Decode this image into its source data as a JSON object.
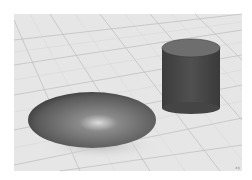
{
  "scene": {
    "description": "3D viewport render with ellipsoid and cylinder on grid floor",
    "objects": [
      {
        "name": "ellipsoid",
        "color": "#6a6a6a"
      },
      {
        "name": "cylinder",
        "color": "#4a4a4a",
        "top_color": "#6e6e6e"
      }
    ],
    "floor_color": "#e4e4e4",
    "grid_color": "#b8b8b8",
    "corner_label": "xy"
  }
}
